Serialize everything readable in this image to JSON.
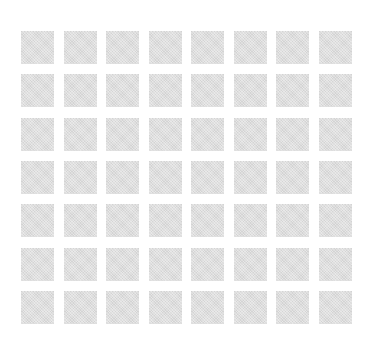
{
  "canvas": {
    "width": 378,
    "height": 350,
    "background_color": "#ffffff"
  },
  "grid": {
    "description": "placeholder-skeleton-grid",
    "rows": 7,
    "columns": 8,
    "total_cells": 56,
    "cell_width": 33,
    "cell_height": 33,
    "column_gap": 9.57,
    "row_gap": 10.33,
    "offset_left": 21,
    "offset_top": 31,
    "cell_color": "#d9d9d9",
    "cell_texture": "fine-grain-noise",
    "cells": [
      {
        "row": 1,
        "col": 1,
        "label": ""
      },
      {
        "row": 1,
        "col": 2,
        "label": ""
      },
      {
        "row": 1,
        "col": 3,
        "label": ""
      },
      {
        "row": 1,
        "col": 4,
        "label": ""
      },
      {
        "row": 1,
        "col": 5,
        "label": ""
      },
      {
        "row": 1,
        "col": 6,
        "label": ""
      },
      {
        "row": 1,
        "col": 7,
        "label": ""
      },
      {
        "row": 1,
        "col": 8,
        "label": ""
      },
      {
        "row": 2,
        "col": 1,
        "label": ""
      },
      {
        "row": 2,
        "col": 2,
        "label": ""
      },
      {
        "row": 2,
        "col": 3,
        "label": ""
      },
      {
        "row": 2,
        "col": 4,
        "label": ""
      },
      {
        "row": 2,
        "col": 5,
        "label": ""
      },
      {
        "row": 2,
        "col": 6,
        "label": ""
      },
      {
        "row": 2,
        "col": 7,
        "label": ""
      },
      {
        "row": 2,
        "col": 8,
        "label": ""
      },
      {
        "row": 3,
        "col": 1,
        "label": ""
      },
      {
        "row": 3,
        "col": 2,
        "label": ""
      },
      {
        "row": 3,
        "col": 3,
        "label": ""
      },
      {
        "row": 3,
        "col": 4,
        "label": ""
      },
      {
        "row": 3,
        "col": 5,
        "label": ""
      },
      {
        "row": 3,
        "col": 6,
        "label": ""
      },
      {
        "row": 3,
        "col": 7,
        "label": ""
      },
      {
        "row": 3,
        "col": 8,
        "label": ""
      },
      {
        "row": 4,
        "col": 1,
        "label": ""
      },
      {
        "row": 4,
        "col": 2,
        "label": ""
      },
      {
        "row": 4,
        "col": 3,
        "label": ""
      },
      {
        "row": 4,
        "col": 4,
        "label": ""
      },
      {
        "row": 4,
        "col": 5,
        "label": ""
      },
      {
        "row": 4,
        "col": 6,
        "label": ""
      },
      {
        "row": 4,
        "col": 7,
        "label": ""
      },
      {
        "row": 4,
        "col": 8,
        "label": ""
      },
      {
        "row": 5,
        "col": 1,
        "label": ""
      },
      {
        "row": 5,
        "col": 2,
        "label": ""
      },
      {
        "row": 5,
        "col": 3,
        "label": ""
      },
      {
        "row": 5,
        "col": 4,
        "label": ""
      },
      {
        "row": 5,
        "col": 5,
        "label": ""
      },
      {
        "row": 5,
        "col": 6,
        "label": ""
      },
      {
        "row": 5,
        "col": 7,
        "label": ""
      },
      {
        "row": 5,
        "col": 8,
        "label": ""
      },
      {
        "row": 6,
        "col": 1,
        "label": ""
      },
      {
        "row": 6,
        "col": 2,
        "label": ""
      },
      {
        "row": 6,
        "col": 3,
        "label": ""
      },
      {
        "row": 6,
        "col": 4,
        "label": ""
      },
      {
        "row": 6,
        "col": 5,
        "label": ""
      },
      {
        "row": 6,
        "col": 6,
        "label": ""
      },
      {
        "row": 6,
        "col": 7,
        "label": ""
      },
      {
        "row": 6,
        "col": 8,
        "label": ""
      },
      {
        "row": 7,
        "col": 1,
        "label": ""
      },
      {
        "row": 7,
        "col": 2,
        "label": ""
      },
      {
        "row": 7,
        "col": 3,
        "label": ""
      },
      {
        "row": 7,
        "col": 4,
        "label": ""
      },
      {
        "row": 7,
        "col": 5,
        "label": ""
      },
      {
        "row": 7,
        "col": 6,
        "label": ""
      },
      {
        "row": 7,
        "col": 7,
        "label": ""
      },
      {
        "row": 7,
        "col": 8,
        "label": ""
      }
    ]
  }
}
